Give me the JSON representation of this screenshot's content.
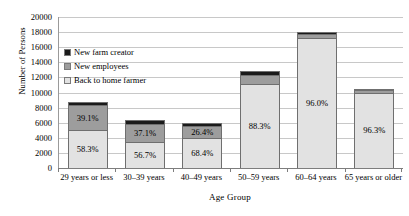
{
  "chart_data": {
    "type": "bar",
    "subtype": "stacked-bar-100-count",
    "title": "",
    "xlabel": "Age Group",
    "ylabel": "Number of Persons",
    "ylim": [
      0,
      20000
    ],
    "ytick_step": 2000,
    "yticks": [
      "20000",
      "18000",
      "16000",
      "14000",
      "12000",
      "10000",
      "8000",
      "6000",
      "4000",
      "2000",
      "0"
    ],
    "ytick_values": [
      20000,
      18000,
      16000,
      14000,
      12000,
      10000,
      8000,
      6000,
      4000,
      2000,
      0
    ],
    "grid": true,
    "legend_position": "upper-left-inside",
    "categories": [
      "29 years or less",
      "30–39 years",
      "40–49 years",
      "50–59 years",
      "60–64 years",
      "65 years or older"
    ],
    "totals": [
      8700,
      6300,
      6000,
      12800,
      18000,
      10500
    ],
    "series": [
      {
        "name": "Back to home farmer",
        "color": "#e2e2e2",
        "values": [
          5072,
          3571,
          4104,
          11302,
          17280,
          10112
        ],
        "percent_labels": [
          "58.3%",
          "56.7%",
          "68.4%",
          "88.3%",
          "96.0%",
          "96.3%"
        ],
        "percents": [
          58.3,
          56.7,
          68.4,
          88.3,
          96.0,
          96.3
        ]
      },
      {
        "name": "New employees",
        "color": "#9d9d9d",
        "values": [
          3402,
          2337,
          1584,
          1203,
          540,
          304
        ],
        "percent_labels": [
          "39.1%",
          "37.1%",
          "26.4%",
          "",
          "",
          ""
        ],
        "percents": [
          39.1,
          37.1,
          26.4,
          9.4,
          3.0,
          2.9
        ]
      },
      {
        "name": "New farm creator",
        "color": "#1a1a1a",
        "values": [
          226,
          391,
          312,
          294,
          180,
          84
        ],
        "percent_labels": [
          "",
          "",
          "",
          "",
          "",
          ""
        ],
        "percents": [
          2.6,
          6.2,
          5.2,
          2.3,
          1.0,
          0.8
        ]
      }
    ]
  },
  "legend": {
    "items": [
      {
        "label": "New farm creator",
        "color": "#1a1a1a"
      },
      {
        "label": "New employees",
        "color": "#9d9d9d"
      },
      {
        "label": "Back to home farmer",
        "color": "#e2e2e2"
      }
    ]
  },
  "axes": {
    "y_title": "Number of Persons",
    "x_title": "Age Group"
  }
}
